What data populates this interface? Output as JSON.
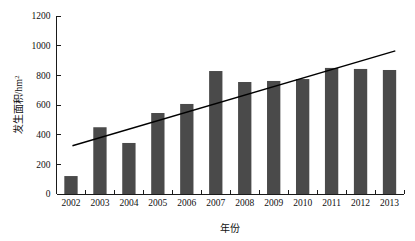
{
  "chart_data": {
    "type": "bar",
    "title": "",
    "xlabel": "年份",
    "ylabel": "发生面积/hm²",
    "ylabel_base": "发生面积/hm",
    "ylabel_sup": "2",
    "categories": [
      "2002",
      "2003",
      "2004",
      "2005",
      "2006",
      "2007",
      "2008",
      "2009",
      "2010",
      "2011",
      "2012",
      "2013"
    ],
    "values": [
      121,
      450,
      344,
      546,
      607,
      829,
      755,
      762,
      775,
      850,
      843,
      836
    ],
    "series": [
      {
        "name": "发生面积",
        "type": "bar",
        "values": [
          121,
          450,
          344,
          546,
          607,
          829,
          755,
          762,
          775,
          850,
          843,
          836
        ]
      },
      {
        "name": "线性趋势线",
        "type": "line",
        "x": [
          "2002",
          "2013"
        ],
        "values": [
          325,
          965
        ]
      }
    ],
    "ylim": [
      0,
      1200
    ],
    "yticks": [
      0,
      200,
      400,
      600,
      800,
      1000,
      1200
    ],
    "ytick_labels": [
      "0",
      "200",
      "400",
      "600",
      "800",
      "1000",
      "1200"
    ],
    "grid": false,
    "legend": "none",
    "bar_color": "#4a4a4a",
    "trendline_color": "#000000",
    "axis_color": "#1a1a1a",
    "background": "#ffffff"
  }
}
